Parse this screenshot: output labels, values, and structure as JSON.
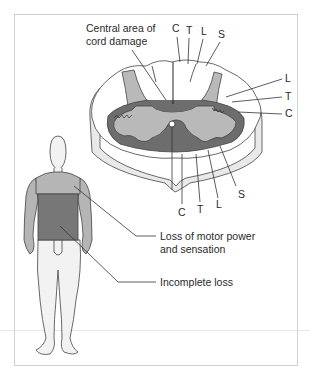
{
  "figure": {
    "colors": {
      "white_matter": "#ffffff",
      "cord_side": "#e9e9e9",
      "gray_matter": "#b9b9b9",
      "damage": "#6d6d6d",
      "body_full_loss": "#777777",
      "body_partial": "#b5b5b5",
      "body_normal": "#f2f2f2",
      "frame": "#cfcfcf"
    }
  },
  "labels": {
    "central_damage_line1": "Central area of",
    "central_damage_line2": "cord damage",
    "top_tracts": [
      "C",
      "T",
      "L",
      "S"
    ],
    "right_tracts": [
      "L",
      "T",
      "C"
    ],
    "bottom_tracts": [
      "C",
      "T",
      "L",
      "S"
    ],
    "motor_loss_line1": "Loss of motor power",
    "motor_loss_line2": "and sensation",
    "incomplete_loss": "Incomplete loss"
  }
}
